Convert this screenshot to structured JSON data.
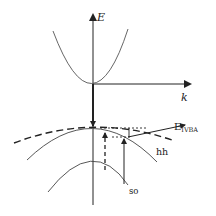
{
  "diagram": {
    "type": "band-structure",
    "axes": {
      "vertical_label": "E",
      "horizontal_label": "k"
    },
    "labels": {
      "energy_level": "E",
      "energy_level_sub": "IVBA",
      "heavy_hole": "hh",
      "split_off": "so"
    },
    "bands": [
      "conduction",
      "heavy-hole",
      "split-off"
    ],
    "colors": {
      "line": "#222222",
      "background": "#ffffff"
    }
  }
}
